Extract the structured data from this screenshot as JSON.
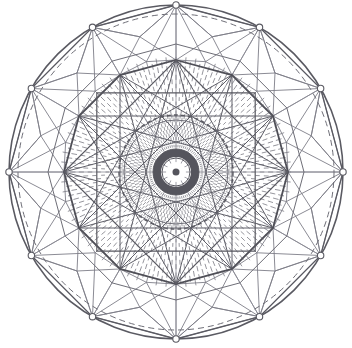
{
  "figure": {
    "kind": "line-drawing",
    "background": "#ffffff",
    "canvas": {
      "width": 352,
      "height": 348
    },
    "center": {
      "x": 176,
      "y": 172
    },
    "symmetry": 12,
    "colors": {
      "stroke_dark": "#5a5a62",
      "stroke_mid": "#6e6e77",
      "stroke_light": "#8c8c95",
      "stroke_faint": "#a8a8b0",
      "dash_fill": "#7b7b84",
      "vertex_fill": "#ffffff",
      "core_dark": "#55555d"
    },
    "rings": [
      {
        "name": "outer-solid-circle",
        "radius": 167,
        "style": "solid",
        "stroke": "#5a5a62",
        "width": 1.6
      },
      {
        "name": "outer-dashed-circle",
        "radius": 158,
        "style": "dashed",
        "stroke": "#6e6e77",
        "width": 1.0,
        "dash": "6 4"
      },
      {
        "name": "dodecagon-outer",
        "radius": 167,
        "style": "polygon-12",
        "stroke": "#5a5a62",
        "width": 1.3
      },
      {
        "name": "dodecagon-ring2",
        "radius": 128,
        "style": "polygon-12",
        "stroke": "#6e6e77",
        "width": 1.0
      },
      {
        "name": "dodecagon-main",
        "radius": 112,
        "style": "polygon-12",
        "stroke": "#4f4f57",
        "width": 1.8
      },
      {
        "name": "hexagram-square-a",
        "radius": 112,
        "style": "polygon-4",
        "stroke": "#5a5a62",
        "width": 1.2
      },
      {
        "name": "inner-dashed-circle",
        "radius": 57,
        "style": "dashed",
        "stroke": "#5a5a62",
        "width": 1.4,
        "dash": "4 3"
      },
      {
        "name": "inner-solid-circle",
        "radius": 52,
        "style": "solid",
        "stroke": "#6e6e77",
        "width": 1.0
      },
      {
        "name": "core-band-outer",
        "radius": 23,
        "style": "solid",
        "stroke": "#55555d",
        "width": 1.0
      },
      {
        "name": "core-band-inner",
        "radius": 14,
        "style": "solid",
        "stroke": "#55555d",
        "width": 1.0
      },
      {
        "name": "core-dot",
        "radius": 4,
        "style": "filled",
        "stroke": "#55555d",
        "width": 1.0
      }
    ],
    "dash_field": {
      "name": "radial-dash-field",
      "inner_radius": 60,
      "outer_radius": 112,
      "ring_count": 13,
      "spokes_per_ring": 72,
      "stroke": "#7b7b84",
      "width": 0.8
    },
    "core_dash_field": {
      "name": "core-radial-dash-field",
      "inner_radius": 26,
      "outer_radius": 56,
      "ring_count": 9,
      "spokes_per_ring": 84,
      "stroke": "#6e6e77",
      "width": 0.7
    },
    "outer_cells": {
      "name": "outer-quad-cell-band",
      "inner_radius": 112,
      "mid_radius": 140,
      "outer_radius": 167,
      "count": 12,
      "stroke": "#7e7e88",
      "width": 0.9
    },
    "star_chords": {
      "name": "dodecagon-star-chords",
      "radius": 112,
      "skips": [
        4,
        5
      ],
      "stroke": "#5f5f68",
      "width": 1.0
    },
    "spokes": {
      "name": "primary-spokes",
      "count": 12,
      "inner_radius": 0,
      "outer_radius": 167,
      "stroke": "#8c8c95",
      "width": 0.8
    },
    "vertex_markers": {
      "name": "outer-vertex-marker",
      "radius": 167,
      "count": 12,
      "marker_radius": 3.2,
      "fill": "#ffffff",
      "stroke": "#5a5a62"
    }
  }
}
